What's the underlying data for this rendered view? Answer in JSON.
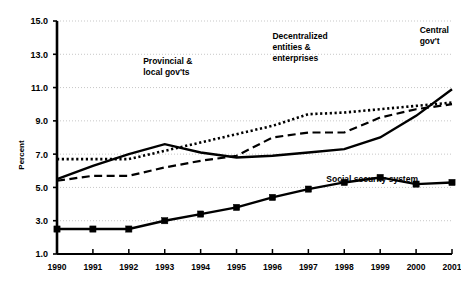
{
  "chart_data": {
    "type": "line",
    "title": "",
    "subtitle": "",
    "xlabel": "",
    "ylabel": "Percent",
    "x": [
      1990,
      1991,
      1992,
      1993,
      1994,
      1995,
      1996,
      1997,
      1998,
      1999,
      2000,
      2001
    ],
    "xtick_labels": [
      "1990",
      "1991",
      "1992",
      "1993",
      "1994",
      "1995",
      "1996",
      "1997",
      "1998",
      "1999",
      "2000",
      "2001"
    ],
    "ytick_labels": [
      "1.0",
      "3.0",
      "5.0",
      "7.0",
      "9.0",
      "11.0",
      "13.0",
      "15.0"
    ],
    "ytick_values": [
      1.0,
      3.0,
      5.0,
      7.0,
      9.0,
      11.0,
      13.0,
      15.0
    ],
    "ylim": [
      1.0,
      15.0
    ],
    "xlim": [
      1990,
      2001
    ],
    "grid": true,
    "grid_axis": "y",
    "legend_position": "inline-annotations",
    "series": [
      {
        "name": "Central gov't",
        "style": "solid",
        "marker": "none",
        "color": "#000000",
        "values": [
          5.5,
          6.3,
          7.0,
          7.6,
          7.1,
          6.8,
          6.9,
          7.1,
          7.3,
          8.0,
          9.3,
          10.9
        ]
      },
      {
        "name": "Provincial & local gov'ts",
        "style": "dotted",
        "marker": "none",
        "color": "#000000",
        "values": [
          6.7,
          6.7,
          6.7,
          7.2,
          7.7,
          8.2,
          8.7,
          9.4,
          9.5,
          9.7,
          9.9,
          10.1
        ]
      },
      {
        "name": "Decentralized entities & enterprises",
        "style": "dashed",
        "marker": "none",
        "color": "#000000",
        "values": [
          5.4,
          5.7,
          5.7,
          6.2,
          6.6,
          6.9,
          8.0,
          8.3,
          8.3,
          9.2,
          9.7,
          10.0
        ]
      },
      {
        "name": "Social security system",
        "style": "solid",
        "marker": "square",
        "color": "#000000",
        "values": [
          2.5,
          2.5,
          2.5,
          3.0,
          3.4,
          3.8,
          4.4,
          4.9,
          5.3,
          5.6,
          5.2,
          5.3
        ]
      }
    ],
    "annotations": [
      {
        "text_lines": [
          "Provincial &",
          "local gov'ts"
        ],
        "x": 1992.4,
        "y": 12.4,
        "align": "start"
      },
      {
        "text_lines": [
          "Decentralized",
          "entities &",
          "enterprises"
        ],
        "x": 1996.0,
        "y": 13.9,
        "align": "start"
      },
      {
        "text_lines": [
          "Central",
          "gov't"
        ],
        "x": 2000.1,
        "y": 14.3,
        "align": "start"
      },
      {
        "text_lines": [
          "Social security system"
        ],
        "x": 1997.5,
        "y": 5.3,
        "align": "start"
      }
    ]
  }
}
